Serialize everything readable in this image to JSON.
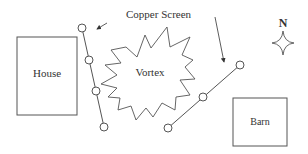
{
  "diagram": {
    "labels": {
      "copper_screen": "Copper Screen",
      "vortex": "Vortex",
      "house": "House",
      "barn": "Barn",
      "north": "N"
    },
    "colors": {
      "line": "#555555",
      "text": "#333333",
      "background": "#ffffff"
    },
    "elements": [
      {
        "type": "building",
        "label": "House"
      },
      {
        "type": "building",
        "label": "Barn"
      },
      {
        "type": "copper-screen",
        "segments": 2,
        "nodes_per_segment": [
          4,
          3
        ]
      },
      {
        "type": "vortex",
        "label": "Vortex"
      },
      {
        "type": "compass",
        "label": "N"
      }
    ]
  }
}
